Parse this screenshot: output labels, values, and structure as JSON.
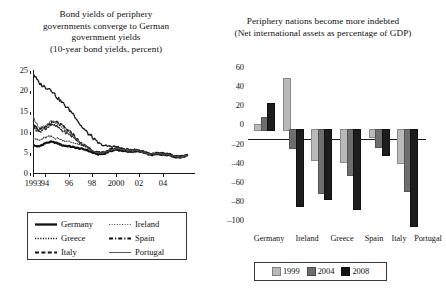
{
  "left": {
    "title_lines": [
      "Bond yields of periphery",
      "governments converge to German",
      "government yields",
      "(10-year bond yields, percent)"
    ],
    "legend": [
      {
        "label": "Germany",
        "style": "solid-thick"
      },
      {
        "label": "Ireland",
        "style": "dotted"
      },
      {
        "label": "Greece",
        "style": "dotted-fine"
      },
      {
        "label": "Spain",
        "style": "dash-dot"
      },
      {
        "label": "Italy",
        "style": "dashed"
      },
      {
        "label": "Portugal",
        "style": "solid-thin"
      }
    ]
  },
  "right": {
    "title_lines": [
      "Periphery nations become more indebted",
      "(Net international assets as percentage of GDP)"
    ],
    "legend": [
      {
        "label": "1999",
        "color": "#b9b9b9"
      },
      {
        "label": "2004",
        "color": "#6e6e6e"
      },
      {
        "label": "2008",
        "color": "#141414"
      }
    ]
  },
  "chart_data": [
    {
      "type": "line",
      "title": "Bond yields of periphery governments converge to German government yields",
      "subtitle": "(10-year bond yields, percent)",
      "xlabel": "",
      "ylabel": "",
      "ylim": [
        0,
        25
      ],
      "yticks": [
        0,
        5,
        10,
        15,
        20,
        25
      ],
      "xlim": [
        1993,
        2006.5
      ],
      "xticks": [
        1993,
        1994,
        1996,
        1998,
        2000,
        2002,
        2004
      ],
      "xticklabels": [
        "1993",
        "94",
        "96",
        "98",
        "2000",
        "02",
        "04"
      ],
      "grid": false,
      "legend_position": "below",
      "series": [
        {
          "name": "Germany",
          "x": [
            1993,
            1993.5,
            1994,
            1994.5,
            1995,
            1995.5,
            1996,
            1996.5,
            1997,
            1997.5,
            1998,
            1998.5,
            1999,
            1999.5,
            2000,
            2000.5,
            2001,
            2001.5,
            2002,
            2002.5,
            2003,
            2003.5,
            2004,
            2004.5,
            2005,
            2005.5,
            2006
          ],
          "values": [
            6.4,
            6.1,
            6.9,
            7.3,
            7.0,
            6.4,
            6.2,
            5.9,
            5.6,
            5.3,
            4.6,
            4.2,
            4.3,
            5.0,
            5.3,
            5.1,
            4.8,
            4.9,
            4.9,
            4.4,
            4.0,
            4.2,
            4.1,
            4.0,
            3.5,
            3.4,
            3.9
          ]
        },
        {
          "name": "Ireland",
          "x": [
            1993,
            1993.5,
            1994,
            1994.5,
            1995,
            1995.5,
            1996,
            1996.5,
            1997,
            1997.5,
            1998,
            1998.5,
            1999,
            1999.5,
            2000,
            2000.5,
            2001,
            2001.5,
            2002,
            2002.5,
            2003,
            2003.5,
            2004,
            2004.5,
            2005,
            2005.5,
            2006
          ],
          "values": [
            8.5,
            7.6,
            8.3,
            8.6,
            8.2,
            7.7,
            7.4,
            7.0,
            6.4,
            6.1,
            5.0,
            4.5,
            4.5,
            5.2,
            5.5,
            5.3,
            5.0,
            5.0,
            5.0,
            4.5,
            4.2,
            4.4,
            4.3,
            4.1,
            3.6,
            3.5,
            4.0
          ]
        },
        {
          "name": "Greece",
          "x": [
            1993,
            1993.5,
            1994,
            1994.5,
            1995,
            1995.5,
            1996,
            1996.5,
            1997,
            1997.5,
            1998,
            1998.5,
            1999,
            1999.5,
            2000,
            2000.5,
            2001,
            2001.5,
            2002,
            2002.5,
            2003,
            2003.5,
            2004,
            2004.5,
            2005,
            2005.5,
            2006
          ],
          "values": [
            24.5,
            22.0,
            21.0,
            20.5,
            18.5,
            17.0,
            15.5,
            14.0,
            11.5,
            9.8,
            8.5,
            7.0,
            6.3,
            6.2,
            6.1,
            5.6,
            5.3,
            5.3,
            5.2,
            4.7,
            4.3,
            4.5,
            4.4,
            4.2,
            3.7,
            3.6,
            4.1
          ]
        },
        {
          "name": "Spain",
          "x": [
            1993,
            1993.5,
            1994,
            1994.5,
            1995,
            1995.5,
            1996,
            1996.5,
            1997,
            1997.5,
            1998,
            1998.5,
            1999,
            1999.5,
            2000,
            2000.5,
            2001,
            2001.5,
            2002,
            2002.5,
            2003,
            2003.5,
            2004,
            2004.5,
            2005,
            2005.5,
            2006
          ],
          "values": [
            11.0,
            9.8,
            10.5,
            11.5,
            11.2,
            10.0,
            9.2,
            8.2,
            6.8,
            6.2,
            5.0,
            4.5,
            4.6,
            5.3,
            5.6,
            5.4,
            5.1,
            5.1,
            5.0,
            4.6,
            4.2,
            4.4,
            4.3,
            4.1,
            3.6,
            3.5,
            4.0
          ]
        },
        {
          "name": "Italy",
          "x": [
            1993,
            1993.5,
            1994,
            1994.5,
            1995,
            1995.5,
            1996,
            1996.5,
            1997,
            1997.5,
            1998,
            1998.5,
            1999,
            1999.5,
            2000,
            2000.5,
            2001,
            2001.5,
            2002,
            2002.5,
            2003,
            2003.5,
            2004,
            2004.5,
            2005,
            2005.5,
            2006
          ],
          "values": [
            12.0,
            10.2,
            10.8,
            12.0,
            12.2,
            11.2,
            10.0,
            8.8,
            7.0,
            6.3,
            5.1,
            4.6,
            4.7,
            5.4,
            5.7,
            5.5,
            5.2,
            5.2,
            5.1,
            4.7,
            4.3,
            4.5,
            4.4,
            4.2,
            3.7,
            3.6,
            4.1
          ]
        },
        {
          "name": "Portugal",
          "x": [
            1993,
            1993.5,
            1994,
            1994.5,
            1995,
            1995.5,
            1996,
            1996.5,
            1997,
            1997.5,
            1998,
            1998.5,
            1999,
            1999.5,
            2000,
            2000.5,
            2001,
            2001.5,
            2002,
            2002.5,
            2003,
            2003.5,
            2004,
            2004.5,
            2005,
            2005.5,
            2006
          ],
          "values": [
            13.5,
            11.0,
            11.0,
            12.4,
            12.0,
            10.8,
            9.6,
            8.5,
            6.9,
            6.2,
            5.0,
            4.5,
            4.6,
            5.3,
            5.6,
            5.4,
            5.1,
            5.1,
            5.0,
            4.6,
            4.2,
            4.4,
            4.3,
            4.1,
            3.6,
            3.5,
            4.0
          ]
        }
      ]
    },
    {
      "type": "bar",
      "title": "Periphery nations become more indebted",
      "subtitle": "(Net international assets as percentage of GDP)",
      "xlabel": "",
      "ylabel": "",
      "ylim": [
        -100,
        60
      ],
      "yticks": [
        60,
        40,
        20,
        0,
        -20,
        -40,
        -60,
        -80,
        -100
      ],
      "yticklabels": [
        "60",
        "40",
        "20",
        "0",
        "–20",
        "–40",
        "–60",
        "–80",
        "–100"
      ],
      "categories": [
        "Germany",
        "Ireland",
        "Greece",
        "Spain",
        "Italy",
        "Portugal"
      ],
      "grid": false,
      "legend_position": "below",
      "series": [
        {
          "name": "1999",
          "color": "#b9b9b9",
          "values": [
            5,
            50,
            -30,
            -32,
            -7,
            -33
          ]
        },
        {
          "name": "2004",
          "color": "#6e6e6e",
          "values": [
            12,
            -18,
            -62,
            -45,
            -17,
            -60
          ]
        },
        {
          "name": "2008",
          "color": "#141414",
          "values": [
            25,
            -75,
            -68,
            -78,
            -25,
            -95
          ]
        }
      ]
    }
  ]
}
